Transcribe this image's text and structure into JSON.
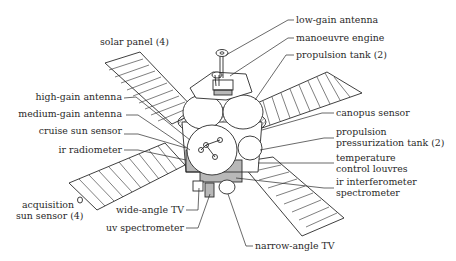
{
  "diagram": {
    "labels_left": [
      {
        "id": "solar-panel",
        "text": "solar panel (4)"
      },
      {
        "id": "high-gain-antenna",
        "text": "high-gain antenna"
      },
      {
        "id": "medium-gain-antenna",
        "text": "medium-gain antenna"
      },
      {
        "id": "cruise-sun-sensor",
        "text": "cruise sun sensor"
      },
      {
        "id": "ir-radiometer",
        "text": "ir radiometer"
      },
      {
        "id": "acquisition-sun-sensor",
        "text": "acquisition\nsun sensor (4)"
      },
      {
        "id": "wide-angle-tv",
        "text": "wide-angle TV"
      },
      {
        "id": "uv-spectrometer",
        "text": "uv spectrometer"
      }
    ],
    "labels_right": [
      {
        "id": "low-gain-antenna",
        "text": "low-gain antenna"
      },
      {
        "id": "manoeuvre-engine",
        "text": "manoeuvre engine"
      },
      {
        "id": "propulsion-tank",
        "text": "propulsion tank (2)"
      },
      {
        "id": "canopus-sensor",
        "text": "canopus sensor"
      },
      {
        "id": "propulsion-pressurization-tank",
        "text": "propulsion\npressurization tank (2)"
      },
      {
        "id": "temperature-control-louvres",
        "text": "temperature\ncontrol louvres"
      },
      {
        "id": "ir-interferometer-spectrometer",
        "text": "ir interferometer\nspectrometer"
      },
      {
        "id": "narrow-angle-tv",
        "text": "narrow-angle TV"
      }
    ],
    "colors": {
      "line": "#2a2a2a",
      "background": "#ffffff"
    }
  }
}
